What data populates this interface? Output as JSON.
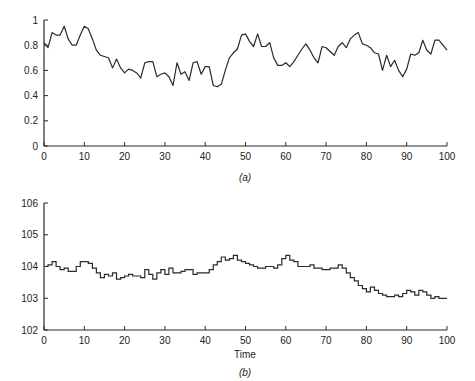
{
  "chart_data": [
    {
      "type": "line",
      "caption": "(a)",
      "title": "",
      "xlabel": "",
      "ylabel": "",
      "xlim": [
        0,
        100
      ],
      "ylim": [
        0,
        1
      ],
      "xticks": [
        "0",
        "10",
        "20",
        "30",
        "40",
        "50",
        "60",
        "70",
        "80",
        "90",
        "100"
      ],
      "yticks": [
        "0",
        "0.2",
        "0.4",
        "0.6",
        "0.8",
        "1"
      ],
      "grid": false,
      "series": [
        {
          "name": "a",
          "x": [
            0,
            1,
            2,
            3,
            4,
            5,
            6,
            7,
            8,
            9,
            10,
            11,
            12,
            13,
            14,
            15,
            16,
            17,
            18,
            19,
            20,
            21,
            22,
            23,
            24,
            25,
            26,
            27,
            28,
            29,
            30,
            31,
            32,
            33,
            34,
            35,
            36,
            37,
            38,
            39,
            40,
            41,
            42,
            43,
            44,
            45,
            46,
            47,
            48,
            49,
            50,
            51,
            52,
            53,
            54,
            55,
            56,
            57,
            58,
            59,
            60,
            61,
            62,
            63,
            64,
            65,
            66,
            67,
            68,
            69,
            70,
            71,
            72,
            73,
            74,
            75,
            76,
            77,
            78,
            79,
            80,
            81,
            82,
            83,
            84,
            85,
            86,
            87,
            88,
            89,
            90,
            91,
            92,
            93,
            94,
            95,
            96,
            97,
            98,
            99,
            100
          ],
          "values": [
            0.82,
            0.78,
            0.9,
            0.88,
            0.88,
            0.95,
            0.85,
            0.8,
            0.8,
            0.88,
            0.95,
            0.93,
            0.85,
            0.76,
            0.72,
            0.71,
            0.7,
            0.62,
            0.69,
            0.62,
            0.58,
            0.61,
            0.6,
            0.58,
            0.54,
            0.66,
            0.67,
            0.67,
            0.55,
            0.57,
            0.58,
            0.55,
            0.48,
            0.66,
            0.57,
            0.59,
            0.52,
            0.66,
            0.67,
            0.57,
            0.63,
            0.63,
            0.48,
            0.47,
            0.49,
            0.6,
            0.7,
            0.74,
            0.77,
            0.88,
            0.89,
            0.83,
            0.79,
            0.89,
            0.79,
            0.79,
            0.82,
            0.7,
            0.64,
            0.64,
            0.66,
            0.63,
            0.67,
            0.72,
            0.77,
            0.81,
            0.76,
            0.7,
            0.66,
            0.79,
            0.78,
            0.75,
            0.72,
            0.79,
            0.82,
            0.78,
            0.85,
            0.88,
            0.9,
            0.81,
            0.8,
            0.78,
            0.74,
            0.73,
            0.6,
            0.72,
            0.63,
            0.68,
            0.6,
            0.55,
            0.61,
            0.73,
            0.72,
            0.74,
            0.84,
            0.76,
            0.73,
            0.84,
            0.84,
            0.8,
            0.76
          ]
        }
      ]
    },
    {
      "type": "line",
      "caption": "(b)",
      "title": "",
      "xlabel": "Time",
      "ylabel": "",
      "xlim": [
        0,
        100
      ],
      "ylim": [
        102,
        106
      ],
      "xticks": [
        "0",
        "10",
        "20",
        "30",
        "40",
        "50",
        "60",
        "70",
        "80",
        "90",
        "100"
      ],
      "yticks": [
        "102",
        "103",
        "104",
        "105",
        "106"
      ],
      "grid": false,
      "step": true,
      "series": [
        {
          "name": "b",
          "x": [
            0,
            1,
            2,
            3,
            4,
            5,
            6,
            7,
            8,
            9,
            10,
            11,
            12,
            13,
            14,
            15,
            16,
            17,
            18,
            19,
            20,
            21,
            22,
            23,
            24,
            25,
            26,
            27,
            28,
            29,
            30,
            31,
            32,
            33,
            34,
            35,
            36,
            37,
            38,
            39,
            40,
            41,
            42,
            43,
            44,
            45,
            46,
            47,
            48,
            49,
            50,
            51,
            52,
            53,
            54,
            55,
            56,
            57,
            58,
            59,
            60,
            61,
            62,
            63,
            64,
            65,
            66,
            67,
            68,
            69,
            70,
            71,
            72,
            73,
            74,
            75,
            76,
            77,
            78,
            79,
            80,
            81,
            82,
            83,
            84,
            85,
            86,
            87,
            88,
            89,
            90,
            91,
            92,
            93,
            94,
            95,
            96,
            97,
            98,
            99
          ],
          "values": [
            104.0,
            104.05,
            104.15,
            104.0,
            103.9,
            103.95,
            103.85,
            103.85,
            104.0,
            104.15,
            104.15,
            104.1,
            103.95,
            103.8,
            103.65,
            103.75,
            103.7,
            103.8,
            103.6,
            103.65,
            103.7,
            103.75,
            103.7,
            103.7,
            103.65,
            103.9,
            103.75,
            103.6,
            103.8,
            103.9,
            103.75,
            103.95,
            103.8,
            103.8,
            103.85,
            103.9,
            103.9,
            103.75,
            103.8,
            103.8,
            103.8,
            103.9,
            104.05,
            104.15,
            104.3,
            104.2,
            104.25,
            104.35,
            104.2,
            104.15,
            104.1,
            104.05,
            104.0,
            103.95,
            103.95,
            104.0,
            104.0,
            103.95,
            104.05,
            104.25,
            104.35,
            104.2,
            104.15,
            104.0,
            104.0,
            104.0,
            104.05,
            103.95,
            103.95,
            103.9,
            103.9,
            103.95,
            103.95,
            104.05,
            103.95,
            103.8,
            103.65,
            103.55,
            103.4,
            103.3,
            103.2,
            103.35,
            103.25,
            103.15,
            103.1,
            103.05,
            103.05,
            103.1,
            103.05,
            103.15,
            103.25,
            103.2,
            103.1,
            103.25,
            103.2,
            103.1,
            103.0,
            103.05,
            103.0,
            103.0
          ]
        }
      ]
    }
  ]
}
